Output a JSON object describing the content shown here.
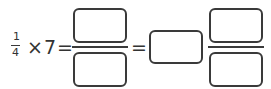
{
  "problem": {
    "given_fraction": {
      "numerator": "1",
      "denominator": "4"
    },
    "operator": "×",
    "multiplier": "7",
    "equals_1": "=",
    "equals_2": "=",
    "answer_fraction": {
      "numerator": "",
      "denominator": ""
    },
    "mixed_number": {
      "whole": "",
      "numerator": "",
      "denominator": ""
    }
  },
  "colors": {
    "stroke": "#3a3a3a",
    "text": "#333333",
    "background": "#ffffff"
  }
}
